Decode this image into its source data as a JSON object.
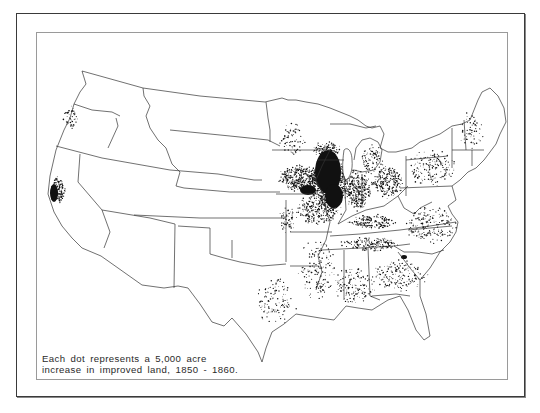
{
  "figure": {
    "caption_lines": [
      "Each dot represents a 5,000 acre",
      "increase in improved land, 1850 - 1860."
    ],
    "legend": {
      "dot_value": "5,000 acre",
      "measure": "increase in improved land",
      "period": "1850 - 1860"
    }
  },
  "colors": {
    "frame": "#3a3a3a",
    "inner_frame": "#9a9a9a",
    "border_line": "#333333",
    "dot": "#111111",
    "background": "#ffffff"
  },
  "map": {
    "subject": "United States, 1860",
    "density_regions": [
      {
        "name": "Illinois core",
        "cx": 330,
        "cy": 182,
        "rx": 22,
        "ry": 30,
        "count": 900
      },
      {
        "name": "Iowa",
        "cx": 300,
        "cy": 178,
        "rx": 24,
        "ry": 14,
        "count": 380
      },
      {
        "name": "Wisconsin south",
        "cx": 326,
        "cy": 150,
        "rx": 16,
        "ry": 9,
        "count": 160
      },
      {
        "name": "Indiana",
        "cx": 358,
        "cy": 190,
        "rx": 14,
        "ry": 22,
        "count": 300
      },
      {
        "name": "Ohio",
        "cx": 388,
        "cy": 182,
        "rx": 18,
        "ry": 18,
        "count": 240
      },
      {
        "name": "Missouri",
        "cx": 318,
        "cy": 210,
        "rx": 26,
        "ry": 16,
        "count": 260
      },
      {
        "name": "Kentucky",
        "cx": 372,
        "cy": 222,
        "rx": 28,
        "ry": 8,
        "count": 160
      },
      {
        "name": "Tennessee",
        "cx": 370,
        "cy": 244,
        "rx": 32,
        "ry": 8,
        "count": 170
      },
      {
        "name": "Pennsylvania/NY",
        "cx": 432,
        "cy": 168,
        "rx": 28,
        "ry": 20,
        "count": 160
      },
      {
        "name": "Virginia/NC",
        "cx": 430,
        "cy": 225,
        "rx": 30,
        "ry": 20,
        "count": 180
      },
      {
        "name": "Georgia/SC",
        "cx": 400,
        "cy": 275,
        "rx": 30,
        "ry": 18,
        "count": 170
      },
      {
        "name": "Alabama/Mississippi",
        "cx": 355,
        "cy": 285,
        "rx": 24,
        "ry": 20,
        "count": 150
      },
      {
        "name": "Arkansas/Louisiana",
        "cx": 318,
        "cy": 270,
        "rx": 22,
        "ry": 34,
        "count": 150
      },
      {
        "name": "East Texas",
        "cx": 275,
        "cy": 300,
        "rx": 24,
        "ry": 26,
        "count": 120
      },
      {
        "name": "Kansas east",
        "cx": 288,
        "cy": 220,
        "rx": 10,
        "ry": 16,
        "count": 60
      },
      {
        "name": "Minnesota",
        "cx": 292,
        "cy": 140,
        "rx": 14,
        "ry": 18,
        "count": 70
      },
      {
        "name": "Michigan",
        "cx": 372,
        "cy": 160,
        "rx": 12,
        "ry": 18,
        "count": 90
      },
      {
        "name": "New England",
        "cx": 470,
        "cy": 130,
        "rx": 14,
        "ry": 22,
        "count": 60
      },
      {
        "name": "California valley",
        "cx": 58,
        "cy": 190,
        "rx": 8,
        "ry": 14,
        "count": 140
      },
      {
        "name": "Oregon Willamette",
        "cx": 70,
        "cy": 118,
        "rx": 8,
        "ry": 14,
        "count": 45
      }
    ],
    "solid_clusters": [
      {
        "name": "Northern Illinois",
        "cx": 328,
        "cy": 172,
        "rx": 13,
        "ry": 22
      },
      {
        "name": "Central Illinois",
        "cx": 334,
        "cy": 196,
        "rx": 9,
        "ry": 12
      },
      {
        "name": "SE Iowa",
        "cx": 308,
        "cy": 190,
        "rx": 8,
        "ry": 5
      },
      {
        "name": "California Sacramento",
        "cx": 54,
        "cy": 193,
        "rx": 4,
        "ry": 9
      },
      {
        "name": "Georgia Piedmont",
        "cx": 404,
        "cy": 257,
        "rx": 3,
        "ry": 2
      }
    ]
  }
}
